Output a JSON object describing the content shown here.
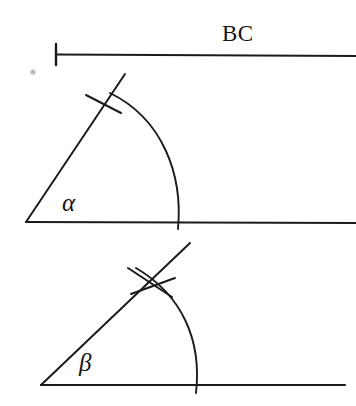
{
  "figure": {
    "background_color": "#ffffff",
    "ink_color": "#1b1b1b",
    "labels": {
      "segment": "BC",
      "angle_one": "α",
      "angle_two": "β"
    },
    "geometry": {
      "segment_bc": {
        "name": "segment-bc",
        "start_x": 56,
        "start_y": 54,
        "end_x": 356,
        "end_y": 56,
        "tick_x": 56,
        "tick_top_y": 44,
        "tick_bottom_y": 65
      },
      "angle_alpha": {
        "name": "angle-alpha",
        "vertex_x": 26,
        "vertex_y": 222,
        "baseline_end_x": 356,
        "baseline_end_y": 223,
        "ray_end_x": 125,
        "ray_end_y": 74,
        "arc_start_x": 178,
        "arc_start_y": 229,
        "arc_control_x": 172,
        "arc_control_y": 120,
        "arc_end_x": 110,
        "arc_end_y": 93,
        "tick_marks": 1,
        "tick_one_x1": 86,
        "tick_one_y1": 95,
        "tick_one_x2": 121,
        "tick_one_y2": 113
      },
      "angle_beta": {
        "name": "angle-beta",
        "vertex_x": 41,
        "vertex_y": 385,
        "baseline_end_x": 345,
        "baseline_end_y": 385,
        "ray_end_x": 190,
        "ray_end_y": 243,
        "arc_start_x": 196,
        "arc_start_y": 393,
        "arc_control_x": 197,
        "arc_control_y": 318,
        "arc_end_x": 136,
        "arc_end_y": 268,
        "tick_marks": 2,
        "tick_one_x1": 128,
        "tick_one_y1": 268,
        "tick_one_x2": 172,
        "tick_one_y2": 297,
        "tick_two_x1": 131,
        "tick_two_y1": 294,
        "tick_two_x2": 175,
        "tick_two_y2": 278
      },
      "speck": {
        "name": "scan-speck",
        "cx": 33,
        "cy": 72,
        "r": 2.6
      }
    }
  }
}
